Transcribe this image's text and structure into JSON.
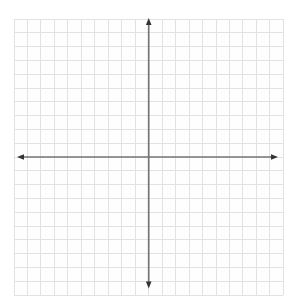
{
  "chart_data": {
    "type": "scatter",
    "title": "",
    "xlabel": "",
    "ylabel": "",
    "series": [],
    "xlim": [
      -10,
      10
    ],
    "ylim": [
      -10,
      10
    ],
    "x_tick_step": 1,
    "y_tick_step": 1,
    "grid": true,
    "grid_cells_x": 20,
    "grid_cells_y": 20,
    "tick_labels_visible": false,
    "axes_centered_at_origin": true,
    "axis_arrowheads": [
      "up",
      "down",
      "left",
      "right"
    ],
    "legend": null,
    "annotations": []
  },
  "colors": {
    "page_background": "#ffffff",
    "paper_background": "#fefefe",
    "grid_line": "#e3e1e1",
    "axis_line": "#757575",
    "arrowhead": "#333333"
  }
}
